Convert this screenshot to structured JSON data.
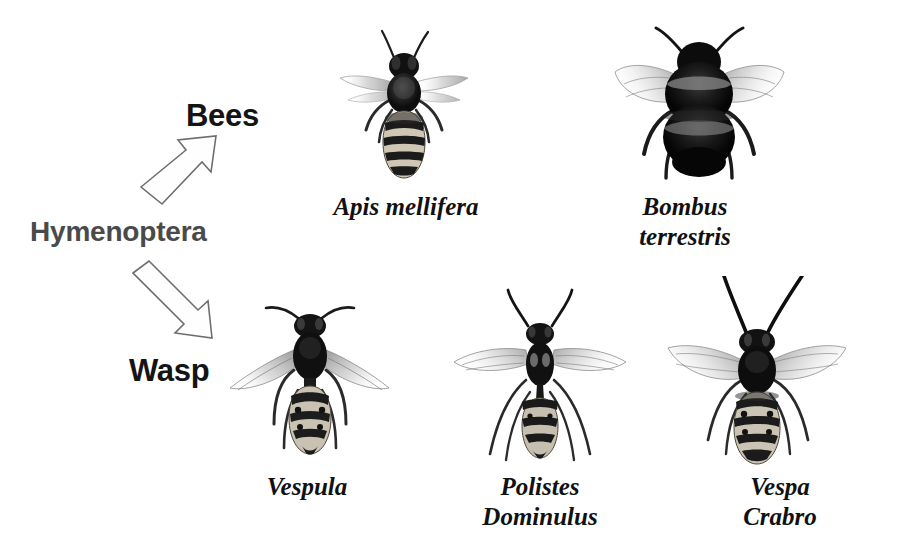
{
  "figure": {
    "background_color": "#ffffff",
    "kind": "labeled-diagram"
  },
  "taxon": {
    "label": "Hymenoptera",
    "color": "#4a4a4a"
  },
  "groups": [
    {
      "id": "bees",
      "label": "Bees",
      "color": "#141414"
    },
    {
      "id": "wasp",
      "label": "Wasp",
      "color": "#141414"
    }
  ],
  "arrows": [
    {
      "id": "arrow-to-bees",
      "direction": "up-right",
      "style": "hollow-block-arrow",
      "outline_color": "#6e6e6e",
      "fill_color": "#fefefe"
    },
    {
      "id": "arrow-to-wasp",
      "direction": "down-right",
      "style": "hollow-block-arrow",
      "outline_color": "#6e6e6e",
      "fill_color": "#fefefe"
    }
  ],
  "specimens": [
    {
      "id": "apis-mellifera",
      "group": "bees",
      "name_line1": "Apis mellifera",
      "name_line2": "",
      "common": "honey bee",
      "posture": "dorsal view, wings swept back",
      "features": "striped banded abdomen, dark furry thorax, translucent wings"
    },
    {
      "id": "bombus-terrestris",
      "group": "bees",
      "name_line1": "Bombus",
      "name_line2": "terrestris",
      "common": "buff-tailed bumblebee",
      "posture": "dorsal view, wings spread wide",
      "features": "very furry rounded body, pale banding, broad veined wings"
    },
    {
      "id": "vespula",
      "group": "wasp",
      "name_line1": "Vespula",
      "name_line2": "",
      "common": "yellowjacket",
      "posture": "dorsal view, wings angled down-outward",
      "features": "dark thorax, spotted banded abdomen, long legs"
    },
    {
      "id": "polistes-dominulus",
      "group": "wasp",
      "name_line1": "Polistes",
      "name_line2": "Dominulus",
      "common": "european paper wasp",
      "posture": "dorsal view, wings spread horizontally",
      "features": "slender petiolate waist, very long legs, clear veined wings"
    },
    {
      "id": "vespa-crabro",
      "group": "wasp",
      "name_line1": "Vespa",
      "name_line2": "Crabro",
      "common": "european hornet",
      "posture": "dorsal view, wings spread, very long antennae",
      "features": "large dark thorax, heavily patterned abdomen, long antennae"
    }
  ]
}
